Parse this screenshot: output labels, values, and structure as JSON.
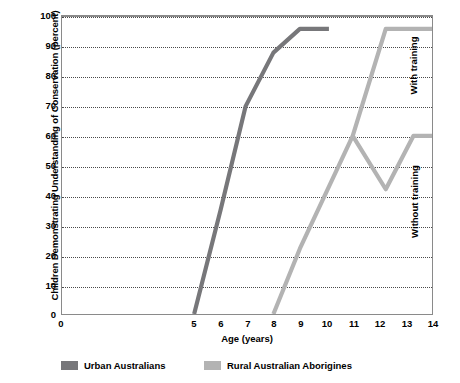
{
  "chart_data": {
    "type": "line",
    "title": "",
    "xlabel": "Age (years)",
    "ylabel": "Children Demonstrating Understanding of Conservation (percent)",
    "xlim": [
      0,
      14
    ],
    "ylim": [
      0,
      100
    ],
    "xticks": [
      0,
      1,
      2,
      3,
      4,
      5,
      6,
      7,
      8,
      9,
      10,
      11,
      12,
      13,
      14
    ],
    "xtick_labels": [
      "0",
      "5",
      "6",
      "7",
      "8",
      "9",
      "10",
      "11",
      "12",
      "13",
      "14"
    ],
    "yticks": [
      0,
      10,
      20,
      30,
      40,
      50,
      60,
      70,
      80,
      90,
      100
    ],
    "ytick_labels": [
      "0",
      "10",
      "20",
      "30",
      "40",
      "50",
      "60",
      "70",
      "80",
      "90",
      "100"
    ],
    "grid": "horizontal-dotted",
    "legend_position": "below-plot",
    "series": [
      {
        "name": "Urban Australians",
        "color": "#77777a",
        "points": [
          {
            "x": 5.0,
            "y": 0
          },
          {
            "x": 6.0,
            "y": 35
          },
          {
            "x": 6.95,
            "y": 70
          },
          {
            "x": 8.0,
            "y": 88
          },
          {
            "x": 9.0,
            "y": 96
          },
          {
            "x": 10.1,
            "y": 96
          }
        ]
      },
      {
        "name": "Rural Australian Aborigines",
        "color": "#b3b3b3",
        "points": [
          {
            "x": 8.0,
            "y": 0
          },
          {
            "x": 9.0,
            "y": 22
          },
          {
            "x": 11.0,
            "y": 60
          },
          {
            "x": 12.25,
            "y": 42
          },
          {
            "x": 13.3,
            "y": 60
          },
          {
            "x": 14.0,
            "y": 60
          }
        ],
        "branch": {
          "label": "With training",
          "points": [
            {
              "x": 11.0,
              "y": 60
            },
            {
              "x": 12.25,
              "y": 96
            },
            {
              "x": 14.0,
              "y": 96
            }
          ]
        }
      }
    ],
    "annotations": [
      {
        "text": "With training",
        "rotation": -90,
        "region": "upper-right"
      },
      {
        "text": "Without training",
        "rotation": -90,
        "region": "lower-right"
      }
    ]
  },
  "axes": {
    "y_title": "Children Demonstrating Understanding of Conservation (percent)",
    "x_title": "Age (years)",
    "y_labels": [
      "100",
      "90",
      "80",
      "70",
      "60",
      "50",
      "40",
      "30",
      "20",
      "10",
      "0"
    ],
    "x_labels": [
      "0",
      "5",
      "6",
      "7",
      "8",
      "9",
      "10",
      "11",
      "12",
      "13",
      "14"
    ]
  },
  "legend": {
    "urban": "Urban Australians",
    "rural": "Rural Australian Aborigines"
  },
  "notes": {
    "with_training": "With training",
    "without_training": "Without training"
  },
  "colors": {
    "urban_line": "#77777a",
    "rural_line": "#b3b3b3",
    "frame": "#8a8a8a",
    "grid": "#4a4a4a"
  }
}
